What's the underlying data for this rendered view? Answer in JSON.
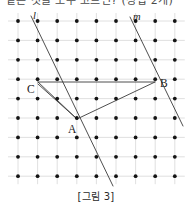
{
  "figure": {
    "caption": "[그림 3]",
    "partial_top_text": "같은 것을 모두 고르면? (정답 2개)",
    "background_color": "#ffffff",
    "grid": {
      "cols": 9,
      "rows": 9,
      "x_start": 18,
      "y_start": 21,
      "x_step": 19.6,
      "y_step": 19.4,
      "dot_color": "#141414",
      "dot_radius": 1.9,
      "gridline_color": "#d8d8d8",
      "gridline_width": 0.8
    },
    "stroke_color": "#3a3a3a",
    "stroke_width": 0.9,
    "points": [
      {
        "name": "C",
        "label": "C",
        "x": 38,
        "y": 82,
        "label_x": 27,
        "label_y": 93
      },
      {
        "name": "B",
        "label": "B",
        "x": 155,
        "y": 82,
        "label_x": 160,
        "label_y": 87
      },
      {
        "name": "A",
        "label": "A",
        "x": 77,
        "y": 119,
        "label_x": 68,
        "label_y": 133
      }
    ],
    "lines": [
      {
        "name": "line-l",
        "label": "l",
        "x1": 31,
        "y1": 16,
        "x2": 113,
        "y2": 186,
        "label_x": 33,
        "label_y": 19
      },
      {
        "name": "line-m",
        "label": "m",
        "x1": 130,
        "y1": 17,
        "x2": 183,
        "y2": 126,
        "label_x": 133,
        "label_y": 20
      }
    ],
    "segments": [
      {
        "name": "segment-cb",
        "x1": 38,
        "y1": 82,
        "x2": 155,
        "y2": 82
      },
      {
        "name": "segment-ca",
        "x1": 38,
        "y1": 84,
        "x2": 77,
        "y2": 119
      },
      {
        "name": "segment-ca-inner",
        "x1": 38,
        "y1": 82,
        "x2": 77,
        "y2": 119
      },
      {
        "name": "segment-ab",
        "x1": 77,
        "y1": 119,
        "x2": 155,
        "y2": 82
      }
    ]
  }
}
